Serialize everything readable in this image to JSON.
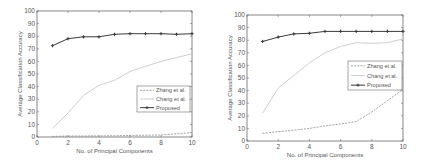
{
  "chart_data": [
    {
      "type": "line",
      "title": "",
      "xlabel": "No. of Principal Components",
      "ylabel": "Average Classification Accuracy",
      "xlim": [
        0,
        10
      ],
      "ylim": [
        0,
        100
      ],
      "xticks": [
        0,
        2,
        4,
        6,
        8,
        10
      ],
      "yticks": [
        0,
        10,
        20,
        30,
        40,
        50,
        60,
        70,
        80,
        90,
        100
      ],
      "grid": false,
      "legend_position": "center right",
      "x": [
        1,
        2,
        3,
        4,
        5,
        6,
        7,
        8,
        9,
        10
      ],
      "series": [
        {
          "name": "Zhang et al.",
          "style": "dashed",
          "color": "#8a8a8a",
          "values": [
            0.5,
            0.8,
            0.8,
            0.9,
            1.0,
            1.2,
            1.4,
            1.6,
            2.5,
            3.5
          ]
        },
        {
          "name": "Chang et al.",
          "style": "solid-light",
          "color": "#c8c8c8",
          "values": [
            7,
            19,
            33,
            41,
            45,
            52,
            56,
            60,
            63,
            66
          ]
        },
        {
          "name": "Proposed",
          "style": "solid-marker",
          "color": "#3a3a3a",
          "values": [
            72.5,
            78,
            79.5,
            79.5,
            81.5,
            82,
            82,
            82,
            81.5,
            82
          ]
        }
      ]
    },
    {
      "type": "line",
      "title": "",
      "xlabel": "No. of Principal Components",
      "ylabel": "Average Classification Accuracy",
      "xlim": [
        0,
        10
      ],
      "ylim": [
        0,
        100
      ],
      "xticks": [
        0,
        2,
        4,
        6,
        8,
        10
      ],
      "yticks": [
        0,
        10,
        20,
        30,
        40,
        50,
        60,
        70,
        80,
        90,
        100
      ],
      "grid": false,
      "legend_position": "center right",
      "x": [
        1,
        2,
        3,
        4,
        5,
        6,
        7,
        8,
        9,
        10
      ],
      "series": [
        {
          "name": "Zhang et al.",
          "style": "dashed",
          "color": "#8a8a8a",
          "values": [
            6,
            7.5,
            8.5,
            10,
            12,
            13.5,
            15.5,
            23,
            32,
            41
          ]
        },
        {
          "name": "Chang et al.",
          "style": "solid-light",
          "color": "#c8c8c8",
          "values": [
            22,
            42,
            52,
            62,
            70,
            75,
            78,
            77.5,
            78,
            81
          ]
        },
        {
          "name": "Proposed",
          "style": "solid-marker",
          "color": "#3a3a3a",
          "values": [
            79,
            82.5,
            85,
            85.5,
            87,
            87,
            87,
            87,
            87,
            87
          ]
        }
      ]
    }
  ],
  "panels": [
    {
      "box": {
        "x0": 37,
        "y0": 11,
        "x1": 192,
        "y1": 137
      },
      "legend": {
        "x": 137,
        "y": 86,
        "w": 53,
        "h": 26
      }
    },
    {
      "box": {
        "x0": 247,
        "y0": 15,
        "x1": 403,
        "y1": 141
      },
      "legend": {
        "x": 348,
        "y": 61,
        "w": 54,
        "h": 29
      }
    }
  ]
}
